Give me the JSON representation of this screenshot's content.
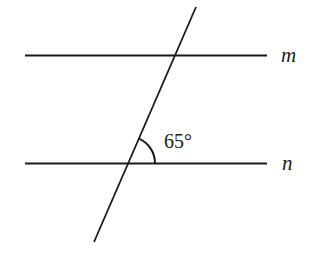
{
  "diagram": {
    "title": "",
    "lines": [
      {
        "id": "m",
        "label": "m",
        "x1": 25,
        "y1": 55.5,
        "x2": 267,
        "y2": 55.5,
        "label_x": 281,
        "label_y": 62
      },
      {
        "id": "n",
        "label": "n",
        "x1": 25,
        "y1": 163.5,
        "x2": 267,
        "y2": 163.5,
        "label_x": 282,
        "label_y": 170
      }
    ],
    "transversal": {
      "x1": 196,
      "y1": 7,
      "x2": 94,
      "y2": 242
    },
    "angle": {
      "label": "65°",
      "vertex": [
        128,
        163.5
      ],
      "radius": 27,
      "label_x": 164,
      "label_y": 148
    },
    "stroke_color": "#1a1a1a",
    "stroke_width": 2
  }
}
